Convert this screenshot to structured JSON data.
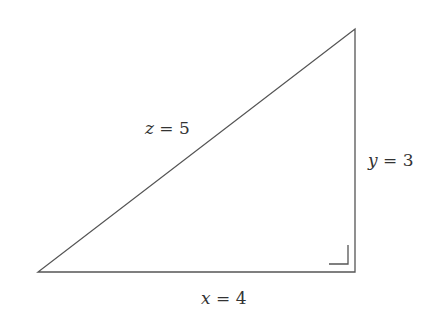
{
  "diagram": {
    "type": "right-triangle",
    "colors": {
      "stroke": "#555555",
      "text": "#333333",
      "background": "#ffffff"
    },
    "vertices": {
      "top": [
        355,
        29
      ],
      "bottom_left": [
        38,
        272
      ],
      "bottom_right": [
        355,
        272
      ]
    },
    "right_angle_at": "bottom_right",
    "labels": {
      "hypotenuse": {
        "var": "z",
        "eq": " = ",
        "value": "5"
      },
      "vertical": {
        "var": "y",
        "eq": " = ",
        "value": "3"
      },
      "horizontal": {
        "var": "x",
        "eq": " = ",
        "value": "4"
      }
    }
  }
}
